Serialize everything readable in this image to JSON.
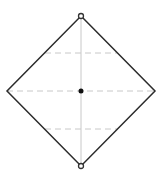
{
  "diagram": {
    "shape": "square-rotated-45",
    "colors": {
      "background": "#ffffff",
      "outline": "#2b2b2b",
      "axis": "#c8c8c8",
      "dashed": "#c8c8c8",
      "center_dot": "#111111",
      "vertex_marker": "#333333"
    },
    "vertices": {
      "top": [
        81,
        16
      ],
      "right": [
        155,
        91
      ],
      "bottom": [
        81,
        166
      ],
      "left": [
        7,
        91
      ]
    },
    "center": [
      81,
      91
    ],
    "dashed_lines_y": [
      53,
      91,
      129
    ],
    "vertex_markers": [
      "top",
      "bottom"
    ]
  }
}
